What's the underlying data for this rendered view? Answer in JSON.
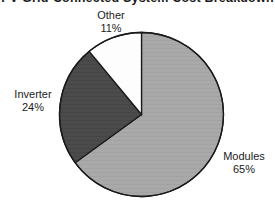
{
  "chart_data": {
    "type": "pie",
    "title": "PV Grid-Connected System Cost Breakdown",
    "title_clipped": true,
    "subtitle": "",
    "xlabel": "",
    "ylabel": "",
    "grid": false,
    "legend_position": "none",
    "labels_position": "outside",
    "start_angle_deg": 0,
    "direction": "clockwise",
    "categories": [
      "Modules",
      "Inverter",
      "Other"
    ],
    "values": [
      65,
      24,
      11
    ],
    "value_unit": "%",
    "slices": [
      {
        "name": "Modules",
        "label": "Modules",
        "value": 65,
        "value_text": "65%",
        "color": "#a8a8a8",
        "start_deg": 0.0,
        "end_deg": 234.0
      },
      {
        "name": "Inverter",
        "label": "Inverter",
        "value": 24,
        "value_text": "24%",
        "color": "#4a4a4a",
        "start_deg": 234.0,
        "end_deg": 320.4
      },
      {
        "name": "Other",
        "label": "Other",
        "value": 11,
        "value_text": "11%",
        "color": "#fdfdfd",
        "start_deg": 320.4,
        "end_deg": 360.0
      }
    ],
    "outline_color": "#1a1a1a",
    "background_color": "#ffffff"
  },
  "figure": {
    "title": "PV Grid-Connected System Cost Breakdown",
    "center_x": 141.5,
    "center_y": 114.5,
    "radius": 82
  },
  "labels": {
    "other": {
      "name": "Other",
      "percent": "11%"
    },
    "inverter": {
      "name": "Inverter",
      "percent": "24%"
    },
    "modules": {
      "name": "Modules",
      "percent": "65%"
    }
  }
}
